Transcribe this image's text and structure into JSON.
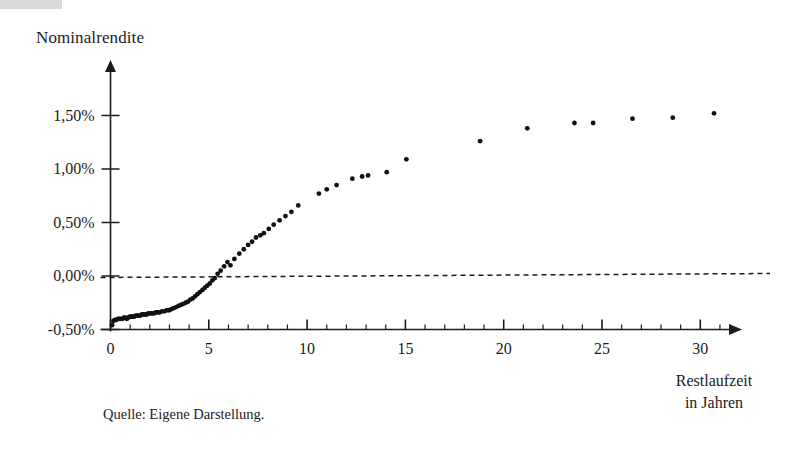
{
  "figure": {
    "y_axis_title": "Nominalrendite",
    "x_axis_title_line1": "Restlaufzeit",
    "x_axis_title_line2": "in Jahren",
    "source_note": "Quelle: Eigene Darstellung.",
    "point_color": "#111111",
    "axis_color": "#1b1b1b",
    "zero_line_color": "#1b1b1b"
  },
  "chart_data": {
    "type": "scatter",
    "title": "",
    "xlabel": "Restlaufzeit in Jahren",
    "ylabel": "Nominalrendite",
    "xlim": [
      0,
      32
    ],
    "ylim": [
      -0.5,
      1.75
    ],
    "grid": false,
    "legend": null,
    "x_ticks_major": [
      0,
      5,
      10,
      15,
      20,
      25,
      30
    ],
    "x_tick_labels": [
      "0",
      "5",
      "10",
      "15",
      "20",
      "25",
      "30"
    ],
    "x_ticks_minor_step": 1,
    "y_ticks": [
      -0.5,
      0.0,
      0.5,
      1.0,
      1.5
    ],
    "y_tick_labels": [
      "-0,50%",
      "0,00%",
      "0,50%",
      "1,00%",
      "1,50%"
    ],
    "y_unit": "percent",
    "annotations": [
      {
        "type": "hline",
        "y": 0.0,
        "style": "dashed",
        "label": "0,00%"
      }
    ],
    "points": [
      [
        0.08,
        -0.46
      ],
      [
        0.15,
        -0.42
      ],
      [
        0.22,
        -0.41
      ],
      [
        0.3,
        -0.41
      ],
      [
        0.38,
        -0.4
      ],
      [
        0.45,
        -0.4
      ],
      [
        0.52,
        -0.4
      ],
      [
        0.6,
        -0.4
      ],
      [
        0.68,
        -0.39
      ],
      [
        0.75,
        -0.39
      ],
      [
        0.83,
        -0.4
      ],
      [
        0.9,
        -0.39
      ],
      [
        0.98,
        -0.38
      ],
      [
        1.05,
        -0.38
      ],
      [
        1.13,
        -0.38
      ],
      [
        1.2,
        -0.38
      ],
      [
        1.28,
        -0.37
      ],
      [
        1.36,
        -0.37
      ],
      [
        1.44,
        -0.37
      ],
      [
        1.52,
        -0.37
      ],
      [
        1.6,
        -0.36
      ],
      [
        1.68,
        -0.36
      ],
      [
        1.76,
        -0.36
      ],
      [
        1.84,
        -0.36
      ],
      [
        1.92,
        -0.35
      ],
      [
        2.0,
        -0.35
      ],
      [
        2.1,
        -0.35
      ],
      [
        2.2,
        -0.35
      ],
      [
        2.3,
        -0.34
      ],
      [
        2.4,
        -0.34
      ],
      [
        2.5,
        -0.34
      ],
      [
        2.62,
        -0.33
      ],
      [
        2.74,
        -0.33
      ],
      [
        2.86,
        -0.32
      ],
      [
        2.98,
        -0.32
      ],
      [
        3.1,
        -0.31
      ],
      [
        3.22,
        -0.3
      ],
      [
        3.34,
        -0.29
      ],
      [
        3.46,
        -0.28
      ],
      [
        3.58,
        -0.27
      ],
      [
        3.7,
        -0.26
      ],
      [
        3.82,
        -0.25
      ],
      [
        3.94,
        -0.24
      ],
      [
        4.06,
        -0.22
      ],
      [
        4.18,
        -0.21
      ],
      [
        4.3,
        -0.19
      ],
      [
        4.42,
        -0.17
      ],
      [
        4.55,
        -0.15
      ],
      [
        4.68,
        -0.13
      ],
      [
        4.8,
        -0.11
      ],
      [
        4.92,
        -0.09
      ],
      [
        5.05,
        -0.07
      ],
      [
        5.18,
        -0.04
      ],
      [
        5.3,
        -0.02
      ],
      [
        5.45,
        0.02
      ],
      [
        5.6,
        0.05
      ],
      [
        5.78,
        0.09
      ],
      [
        5.95,
        0.13
      ],
      [
        6.1,
        0.1
      ],
      [
        6.3,
        0.16
      ],
      [
        6.55,
        0.21
      ],
      [
        6.78,
        0.25
      ],
      [
        7.0,
        0.29
      ],
      [
        7.2,
        0.32
      ],
      [
        7.4,
        0.36
      ],
      [
        7.62,
        0.38
      ],
      [
        7.8,
        0.4
      ],
      [
        8.05,
        0.44
      ],
      [
        8.3,
        0.48
      ],
      [
        8.6,
        0.52
      ],
      [
        8.9,
        0.56
      ],
      [
        9.2,
        0.6
      ],
      [
        9.55,
        0.66
      ],
      [
        10.6,
        0.77
      ],
      [
        11.0,
        0.81
      ],
      [
        11.5,
        0.85
      ],
      [
        12.3,
        0.91
      ],
      [
        12.8,
        0.93
      ],
      [
        13.1,
        0.94
      ],
      [
        14.05,
        0.97
      ],
      [
        15.05,
        1.09
      ],
      [
        18.8,
        1.26
      ],
      [
        21.2,
        1.38
      ],
      [
        23.6,
        1.43
      ],
      [
        24.55,
        1.43
      ],
      [
        26.55,
        1.47
      ],
      [
        28.6,
        1.48
      ],
      [
        30.7,
        1.52
      ]
    ]
  }
}
